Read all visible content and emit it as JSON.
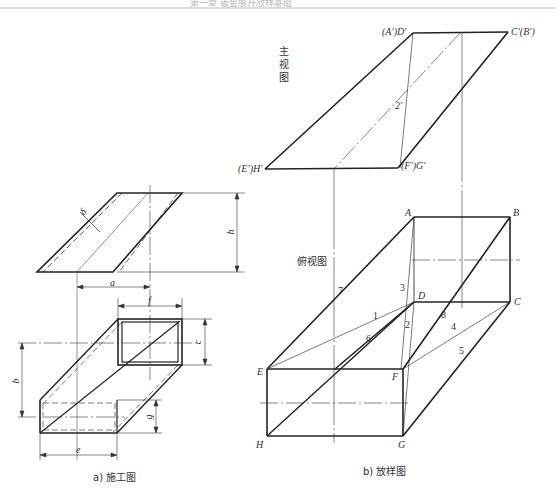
{
  "header": {
    "text": "第一章 钣金展开放样基础"
  },
  "figure_a": {
    "caption": "a) 施工图",
    "dimensions": {
      "delta": "δ",
      "h": "h",
      "a": "a",
      "f": "f",
      "c": "c",
      "b": "b",
      "g": "g",
      "e": "e"
    }
  },
  "figure_b": {
    "caption": "b) 放样图",
    "front_view_label": "主视图",
    "front_view_label_chars": [
      "主",
      "视",
      "图"
    ],
    "top_view_label": "俯视图",
    "front_points": {
      "ad": "(A′)D′",
      "cb": "C′(B′)",
      "eh": "(E′)H′",
      "fg": "(F′)G′",
      "line2": "2′"
    },
    "top_points": {
      "A": "A",
      "B": "B",
      "C": "C",
      "D": "D",
      "E": "E",
      "F": "F",
      "G": "G",
      "H": "H"
    },
    "line_numbers": [
      "1",
      "2",
      "3",
      "4",
      "5",
      "6",
      "7",
      "8"
    ]
  }
}
